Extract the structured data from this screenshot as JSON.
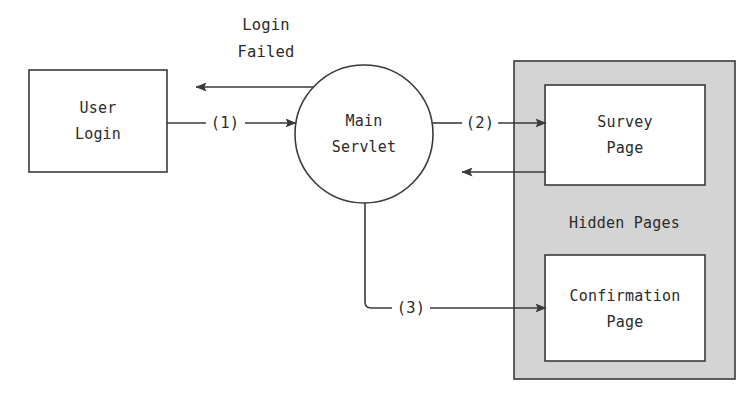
{
  "diagram": {
    "colors": {
      "stroke": "#3a3a3a",
      "text": "#2b2b2b",
      "node_fill": "#ffffff",
      "group_fill": "#d4d4d4",
      "background": "#ffffff"
    },
    "nodes": {
      "user_login": {
        "label_line1": "User",
        "label_line2": "Login",
        "shape": "rectangle"
      },
      "main_servlet": {
        "label_line1": "Main",
        "label_line2": "Servlet",
        "shape": "circle"
      },
      "survey_page": {
        "label_line1": "Survey",
        "label_line2": "Page",
        "shape": "rectangle"
      },
      "confirmation_page": {
        "label_line1": "Confirmation",
        "label_line2": "Page",
        "shape": "rectangle"
      }
    },
    "group": {
      "label": "Hidden Pages"
    },
    "edges": {
      "login_to_servlet": {
        "label": "(1)"
      },
      "servlet_to_login": {
        "label_line1": "Login",
        "label_line2": "Failed"
      },
      "servlet_to_survey": {
        "label": "(2)"
      },
      "survey_to_servlet": {
        "label": ""
      },
      "servlet_to_confirmation": {
        "label": "(3)"
      }
    }
  }
}
